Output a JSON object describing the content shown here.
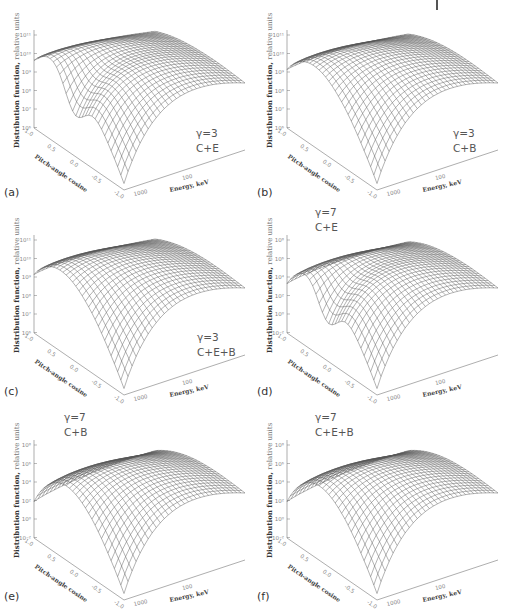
{
  "figure": {
    "panels": [
      {
        "id": "a",
        "label": "(a)",
        "gamma": "γ=3",
        "case": "C+E",
        "y_ticks": [
          "10¹¹",
          "10¹⁰",
          "10⁹",
          "10⁸",
          "10⁷",
          "10⁶"
        ],
        "dip": true,
        "left_level": 0.62,
        "ylow": "1.0"
      },
      {
        "id": "b",
        "label": "(b)",
        "gamma": "γ=3",
        "case": "C+B",
        "y_ticks": [
          "10¹¹",
          "10¹⁰",
          "10⁹",
          "10⁸",
          "10⁷",
          "10⁶"
        ],
        "dip": false,
        "left_level": 0.55,
        "ylow": "1.0"
      },
      {
        "id": "c",
        "label": "(c)",
        "gamma": "γ=3",
        "case": "C+E+B",
        "y_ticks": [
          "10¹¹",
          "10¹⁰",
          "10⁹",
          "10⁸",
          "10⁷",
          "10⁶"
        ],
        "dip": false,
        "left_level": 0.55,
        "ylow": "1.0"
      },
      {
        "id": "d",
        "label": "(d)",
        "gamma": "γ=7",
        "case": "C+E",
        "y_ticks": [
          "10⁸",
          "10⁶",
          "10⁴",
          "10²",
          "10⁰",
          "10⁻²"
        ],
        "dip": true,
        "left_level": 0.48,
        "ylow": "1.0"
      },
      {
        "id": "e",
        "label": "(e)",
        "gamma": "γ=7",
        "case": "C+B",
        "y_ticks": [
          "10⁸",
          "10⁶",
          "10⁴",
          "10²",
          "10⁰",
          "10⁻²"
        ],
        "dip": false,
        "left_level": 0.38,
        "ylow": "1.0"
      },
      {
        "id": "f",
        "label": "(f)",
        "gamma": "γ=7",
        "case": "C+E+B",
        "y_ticks": [
          "10⁸",
          "10⁶",
          "10⁴",
          "10²",
          "10⁰",
          "10⁻²"
        ],
        "dip": false,
        "left_level": 0.38,
        "ylow": "1.0"
      }
    ],
    "y_axis_label": "Distribution function,",
    "y_axis_units": "relative units",
    "pitch_axis_label": "Pitch-angle cosine",
    "pitch_ticks": [
      "1.0",
      "0.5",
      "0.0",
      "-0.5",
      "-1.0"
    ],
    "energy_axis_label": "Energy, keV",
    "energy_ticks": [
      "1000",
      "100"
    ]
  },
  "chart_data": [
    {
      "type": "surface",
      "panel": "a",
      "title": "γ=3, C+E",
      "xlabel": "Energy, keV",
      "ylabel": "Pitch-angle cosine",
      "zlabel": "Distribution function, relative units",
      "z_scale": "log",
      "z_ticks": [
        1000000.0,
        10000000.0,
        100000000.0,
        1000000000.0,
        10000000000.0,
        100000000000.0
      ],
      "y_range": [
        -1.0,
        1.0
      ],
      "x_ticks": [
        1000,
        100
      ],
      "notes": "peak ~1e11 near mu=0, dip near mu=-1 at high energy"
    },
    {
      "type": "surface",
      "panel": "b",
      "title": "γ=3, C+B",
      "xlabel": "Energy, keV",
      "ylabel": "Pitch-angle cosine",
      "zlabel": "Distribution function, relative units",
      "z_scale": "log",
      "z_ticks": [
        1000000.0,
        10000000.0,
        100000000.0,
        1000000000.0,
        10000000000.0,
        100000000000.0
      ],
      "y_range": [
        -1.0,
        1.0
      ],
      "x_ticks": [
        1000,
        100
      ]
    },
    {
      "type": "surface",
      "panel": "c",
      "title": "γ=3, C+E+B",
      "xlabel": "Energy, keV",
      "ylabel": "Pitch-angle cosine",
      "zlabel": "Distribution function, relative units",
      "z_scale": "log",
      "z_ticks": [
        1000000.0,
        10000000.0,
        100000000.0,
        1000000000.0,
        10000000000.0,
        100000000000.0
      ],
      "y_range": [
        -1.0,
        1.0
      ],
      "x_ticks": [
        1000,
        100
      ]
    },
    {
      "type": "surface",
      "panel": "d",
      "title": "γ=7, C+E",
      "xlabel": "Energy, keV",
      "ylabel": "Pitch-angle cosine",
      "zlabel": "Distribution function, relative units",
      "z_scale": "log",
      "z_ticks": [
        0.01,
        1.0,
        100.0,
        10000.0,
        1000000.0,
        100000000.0
      ],
      "y_range": [
        -1.0,
        1.0
      ],
      "x_ticks": [
        1000,
        100
      ]
    },
    {
      "type": "surface",
      "panel": "e",
      "title": "γ=7, C+B",
      "xlabel": "Energy, keV",
      "ylabel": "Pitch-angle cosine",
      "zlabel": "Distribution function, relative units",
      "z_scale": "log",
      "z_ticks": [
        0.01,
        1.0,
        100.0,
        10000.0,
        1000000.0,
        100000000.0
      ],
      "y_range": [
        -1.0,
        1.0
      ],
      "x_ticks": [
        1000,
        100
      ]
    },
    {
      "type": "surface",
      "panel": "f",
      "title": "γ=7, C+E+B",
      "xlabel": "Energy, keV",
      "ylabel": "Pitch-angle cosine",
      "zlabel": "Distribution function, relative units",
      "z_scale": "log",
      "z_ticks": [
        0.01,
        1.0,
        100.0,
        10000.0,
        1000000.0,
        100000000.0
      ],
      "y_range": [
        -1.0,
        1.0
      ],
      "x_ticks": [
        1000,
        100
      ]
    }
  ]
}
